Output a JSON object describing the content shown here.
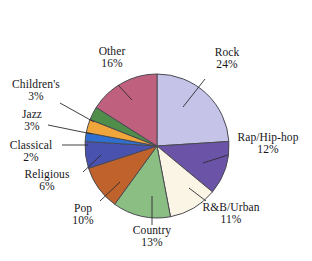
{
  "chart_data": {
    "type": "pie",
    "title": "",
    "subtitle": "",
    "xlabel": "",
    "ylabel": "",
    "legend_position": "labels-with-leader-lines",
    "grid": false,
    "units": "percent",
    "categories": [
      "Rock",
      "Rap/Hip-hop",
      "R&B/Urban",
      "Country",
      "Pop",
      "Religious",
      "Classical",
      "Jazz",
      "Children's",
      "Other"
    ],
    "values": [
      24,
      12,
      11,
      13,
      10,
      6,
      2,
      3,
      3,
      16
    ],
    "value_labels": [
      "24%",
      "12%",
      "11%",
      "13%",
      "10%",
      "6%",
      "2%",
      "3%",
      "3%",
      "16%"
    ],
    "colors": [
      "#C5C4E8",
      "#6B54A8",
      "#FAF5E4",
      "#8BBE83",
      "#C0622C",
      "#4A52B0",
      "#2F6FD0",
      "#F0A63A",
      "#4E8E4A",
      "#C0607F"
    ],
    "slice_outline_color": "#4A4A52",
    "background_color": "#FFFFFF"
  },
  "slices": [
    {
      "label": "Rock",
      "pct": "24%",
      "color": "#C5C4E8"
    },
    {
      "label": "Rap/Hip-hop",
      "pct": "12%",
      "color": "#6B54A8"
    },
    {
      "label": "R&B/Urban",
      "pct": "11%",
      "color": "#FAF5E4"
    },
    {
      "label": "Country",
      "pct": "13%",
      "color": "#8BBE83"
    },
    {
      "label": "Pop",
      "pct": "10%",
      "color": "#C0622C"
    },
    {
      "label": "Religious",
      "pct": "6%",
      "color": "#4A52B0"
    },
    {
      "label": "Classical",
      "pct": "2%",
      "color": "#2F6FD0"
    },
    {
      "label": "Jazz",
      "pct": "3%",
      "color": "#F0A63A"
    },
    {
      "label": "Children's",
      "pct": "3%",
      "color": "#4E8E4A"
    },
    {
      "label": "Other",
      "pct": "16%",
      "color": "#C0607F"
    }
  ]
}
